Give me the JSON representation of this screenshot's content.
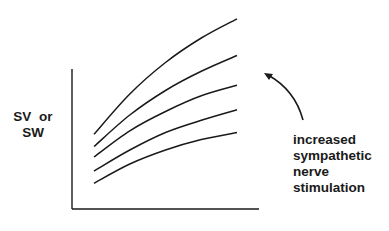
{
  "chart_data": {
    "type": "line",
    "title": "",
    "xlabel": "",
    "ylabel": "SV or SW",
    "ylabel_lines": [
      "SV or",
      "SW"
    ],
    "grid": false,
    "xlim": [
      0,
      10
    ],
    "ylim": [
      0,
      10
    ],
    "x": [
      0,
      2.5,
      5,
      7.5,
      10
    ],
    "series": [
      {
        "name": "curve-5",
        "values": [
          4.5,
          6.8,
          8.6,
          10.0,
          11.1
        ]
      },
      {
        "name": "curve-4",
        "values": [
          3.8,
          5.6,
          7.0,
          8.1,
          9.0
        ]
      },
      {
        "name": "curve-3",
        "values": [
          3.2,
          4.7,
          5.8,
          6.7,
          7.3
        ]
      },
      {
        "name": "curve-2",
        "values": [
          2.4,
          3.6,
          4.6,
          5.3,
          5.9
        ]
      },
      {
        "name": "curve-1",
        "values": [
          1.7,
          2.8,
          3.6,
          4.2,
          4.6
        ]
      }
    ],
    "annotations": [
      {
        "text_lines": [
          "increased",
          "sympathetic",
          "nerve",
          "stimulation"
        ],
        "arrow": "curved-up-left",
        "meaning": "curves shift upward"
      }
    ]
  },
  "labels": {
    "y_line1": "SV or",
    "y_line2": "SW",
    "annot": [
      "increased",
      "sympathetic",
      "nerve",
      "stimulation"
    ]
  },
  "colors": {
    "ink": "#1a1a1a",
    "background": "#ffffff"
  }
}
